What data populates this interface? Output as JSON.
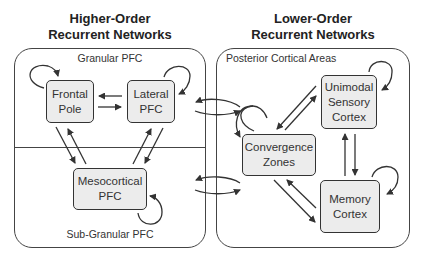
{
  "diagram": {
    "left": {
      "title_line1": "Higher-Order",
      "title_line2": "Recurrent Networks",
      "top_region_label": "Granular PFC",
      "bottom_region_label": "Sub-Granular PFC",
      "nodes": [
        {
          "id": "frontal-pole",
          "line1": "Frontal",
          "line2": "Pole"
        },
        {
          "id": "lateral-pfc",
          "line1": "Lateral",
          "line2": "PFC"
        },
        {
          "id": "mesocortical-pfc",
          "line1": "Mesocortical",
          "line2": "PFC"
        }
      ]
    },
    "right": {
      "title_line1": "Lower-Order",
      "title_line2": "Recurrent Networks",
      "region_label": "Posterior Cortical Areas",
      "nodes": [
        {
          "id": "unimodal-sensory-cortex",
          "line1": "Unimodal",
          "line2": "Sensory",
          "line3": "Cortex"
        },
        {
          "id": "convergence-zones",
          "line1": "Convergence",
          "line2": "Zones"
        },
        {
          "id": "memory-cortex",
          "line1": "Memory",
          "line2": "Cortex"
        }
      ]
    },
    "edges": [
      {
        "from": "Frontal Pole",
        "to": "Lateral PFC",
        "bidirectional": true
      },
      {
        "from": "Frontal Pole",
        "to": "Mesocortical PFC",
        "bidirectional": true
      },
      {
        "from": "Lateral PFC",
        "to": "Mesocortical PFC",
        "bidirectional": true
      },
      {
        "from": "Unimodal Sensory Cortex",
        "to": "Convergence Zones",
        "bidirectional": true
      },
      {
        "from": "Unimodal Sensory Cortex",
        "to": "Memory Cortex",
        "bidirectional": true
      },
      {
        "from": "Convergence Zones",
        "to": "Memory Cortex",
        "bidirectional": true
      },
      {
        "from": "Higher-Order (Granular PFC)",
        "to": "Lower-Order",
        "bidirectional": true
      },
      {
        "from": "Higher-Order (Sub-Granular PFC)",
        "to": "Lower-Order",
        "bidirectional": true
      }
    ],
    "self_loops": [
      "Frontal Pole",
      "Lateral PFC",
      "Mesocortical PFC",
      "Unimodal Sensory Cortex",
      "Convergence Zones",
      "Memory Cortex"
    ],
    "colors": {
      "node_fill": "#ececec",
      "stroke": "#333333",
      "background": "#ffffff"
    }
  }
}
